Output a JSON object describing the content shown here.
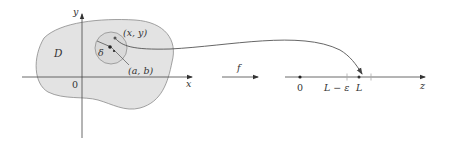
{
  "diagram": {
    "type": "function-limit-of-two-variables",
    "colors": {
      "region_fill": "#e3e3e3",
      "region_stroke": "#8a8a8a",
      "disk_fill": "#d9d9d9",
      "disk_stroke": "#8f8f8f",
      "axis": "#444444",
      "curve": "#555555",
      "point": "#222222",
      "tick": "#aaaaaa"
    },
    "domain_plane": {
      "region_label": "D",
      "x_axis_label": "x",
      "y_axis_label": "y",
      "origin_label": "0",
      "disk_radius_label": "δ",
      "point_label": "(x, y)",
      "center_label": "(a, b)"
    },
    "mapping": {
      "arrow_label": "f"
    },
    "number_line": {
      "axis_label": "z",
      "origin_label": "0",
      "lower_bound_label": "L − ε",
      "limit_label": "L",
      "upper_bound_label": "L + ε"
    }
  }
}
